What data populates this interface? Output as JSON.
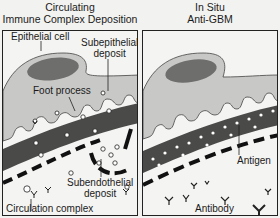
{
  "panels": [
    {
      "title_line1": "Circulating",
      "title_line2": "Immune Complex Deposition",
      "labels": {
        "epithelial_cell": "Epithelial cell",
        "subepithelial_1": "Subepithelial",
        "subepithelial_2": "deposit",
        "foot_process": "Foot process",
        "subendothelial_1": "Subendothelial",
        "subendothelial_2": "deposit",
        "circulation_complex": "Circulation complex"
      }
    },
    {
      "title_line1": "In Situ",
      "title_line2": "Anti-GBM",
      "labels": {
        "antigen": "Antigen",
        "antibody": "Antibody"
      }
    }
  ],
  "colors": {
    "background": "#f4f4f2",
    "cell_fill": "#c8c8c6",
    "nucleus": "#6e6e6c",
    "membrane": "#4a4a48",
    "line": "#1a1a1a"
  }
}
